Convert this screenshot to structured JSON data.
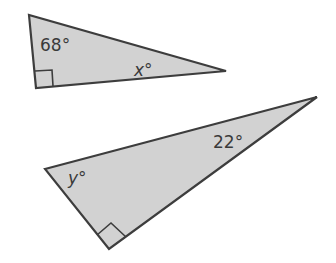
{
  "colors": {
    "fill": "#d2d2d2",
    "stroke": "#3d3d3d",
    "text": "#3a3a3a"
  },
  "triangles": [
    {
      "name": "triangle-1",
      "vertices": [
        [
          29,
          15
        ],
        [
          36,
          88
        ],
        [
          226,
          71
        ]
      ],
      "right_angle_at": "bottom-left",
      "labels": {
        "known_angle": "68°",
        "unknown_angle": "x°"
      }
    },
    {
      "name": "triangle-2",
      "vertices": [
        [
          45,
          169
        ],
        [
          317,
          97
        ],
        [
          109,
          249
        ]
      ],
      "right_angle_at": "bottom",
      "labels": {
        "known_angle": "22°",
        "unknown_angle": "y°"
      }
    }
  ]
}
